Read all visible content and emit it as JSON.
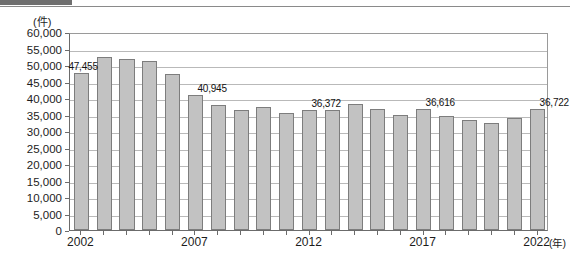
{
  "header": {
    "tag_text": "",
    "title_text": ""
  },
  "chart_data": {
    "type": "bar",
    "title": "",
    "xlabel": "(年)",
    "ylabel": "(件)",
    "unit_label": "(件)",
    "xaxis_unit": "(年)",
    "ylim": [
      0,
      60000
    ],
    "ytick_step": 5000,
    "grid": true,
    "legend": "none",
    "y_ticks": [
      "60,000",
      "55,000",
      "50,000",
      "45,000",
      "40,000",
      "35,000",
      "30,000",
      "25,000",
      "20,000",
      "15,000",
      "10,000",
      "5,000",
      "0"
    ],
    "x_tick_labels": [
      "2002",
      "2007",
      "2012",
      "2017",
      "2022"
    ],
    "categories": [
      "2002",
      "2003",
      "2004",
      "2005",
      "2006",
      "2007",
      "2008",
      "2009",
      "2010",
      "2011",
      "2012",
      "2013",
      "2014",
      "2015",
      "2016",
      "2017",
      "2018",
      "2019",
      "2020",
      "2021",
      "2022"
    ],
    "values": [
      47455,
      52500,
      51800,
      51200,
      47200,
      40945,
      37900,
      36300,
      37300,
      35500,
      36372,
      36400,
      38200,
      36800,
      34900,
      36616,
      34400,
      33400,
      32500,
      34000,
      36722
    ],
    "data_labels": [
      {
        "category": "2002",
        "text": "47,455"
      },
      {
        "category": "2007",
        "text": "40,945"
      },
      {
        "category": "2012",
        "text": "36,372"
      },
      {
        "category": "2017",
        "text": "36,616"
      },
      {
        "category": "2022",
        "text": "36,722"
      }
    ],
    "colors": {
      "bar_fill": "#c2c2c2",
      "bar_stroke": "#7d7d7d",
      "gridline": "#b9b9b9",
      "axis": "#6b6b6b",
      "text": "#1c1c1c"
    }
  }
}
